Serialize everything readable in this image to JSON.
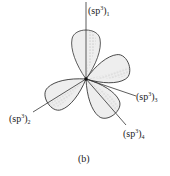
{
  "diagram": {
    "colors": {
      "line": "#333333",
      "lobe_fill": "#eeeeee",
      "shade": "#777777"
    },
    "center": {
      "x": 86,
      "y": 79
    },
    "orbitals": [
      {
        "base": "(sp",
        "sup": "3",
        "close": ")",
        "sub": "1"
      },
      {
        "base": "(sp",
        "sup": "3",
        "close": ")",
        "sub": "2"
      },
      {
        "base": "(sp",
        "sup": "3",
        "close": ")",
        "sub": "3"
      },
      {
        "base": "(sp",
        "sup": "3",
        "close": ")",
        "sub": "4"
      }
    ],
    "caption": "(b)"
  }
}
